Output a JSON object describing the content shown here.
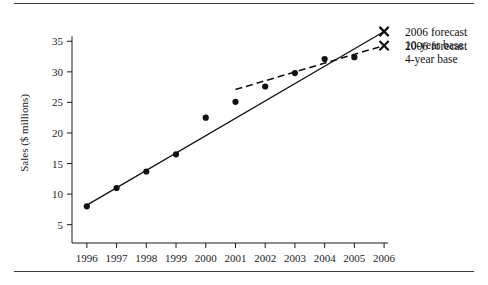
{
  "chart_data": {
    "type": "scatter",
    "title": "",
    "xlabel": "",
    "ylabel": "Sales ($ millions)",
    "x": [
      1996,
      1997,
      1998,
      1999,
      2000,
      2001,
      2002,
      2003,
      2004,
      2005
    ],
    "values": [
      8.0,
      11.0,
      13.7,
      16.5,
      22.5,
      25.1,
      27.6,
      29.8,
      32.1,
      32.4
    ],
    "xlim": [
      1995.5,
      2006.3
    ],
    "ylim": [
      2.0,
      37.5
    ],
    "xticks": [
      "1996",
      "1997",
      "1998",
      "1999",
      "2000",
      "2001",
      "2002",
      "2003",
      "2004",
      "2005",
      "2006"
    ],
    "xtick_values": [
      1996,
      1997,
      1998,
      1999,
      2000,
      2001,
      2002,
      2003,
      2004,
      2005,
      2006
    ],
    "yticks": [
      "5",
      "10",
      "15",
      "20",
      "25",
      "30",
      "35"
    ],
    "ytick_values": [
      5,
      10,
      15,
      20,
      25,
      30,
      35
    ],
    "grid": false,
    "legend_position": "top-right",
    "series": [
      {
        "name": "observed-sales",
        "style": "points",
        "x": [
          1996,
          1997,
          1998,
          1999,
          2000,
          2001,
          2002,
          2003,
          2004,
          2005
        ],
        "values": [
          8.0,
          11.0,
          13.7,
          16.5,
          22.5,
          25.1,
          27.6,
          29.8,
          32.1,
          32.4
        ]
      },
      {
        "name": "10-year base trend",
        "style": "solid-line",
        "x": [
          1996,
          2006
        ],
        "values": [
          8.2,
          36.6
        ],
        "endpoint_marker": "x",
        "endpoint_x": 2006,
        "endpoint_value": 36.6
      },
      {
        "name": "4-year base trend",
        "style": "dashed-line",
        "x": [
          2001,
          2006
        ],
        "values": [
          27.1,
          34.3
        ],
        "endpoint_marker": "x",
        "endpoint_x": 2006,
        "endpoint_value": 34.3
      }
    ],
    "annotations": [
      {
        "marker": "x",
        "lines": [
          "2006 forecast",
          "10-year base"
        ]
      },
      {
        "marker": "x",
        "lines": [
          "2006 forecast",
          "4-year base"
        ]
      }
    ]
  },
  "legend": {
    "entries": [
      {
        "marker": "x-marker",
        "line1": "2006 forecast",
        "line2": "10-year base"
      },
      {
        "marker": "x-marker",
        "line1": "2006 forecast",
        "line2": "4-year base"
      }
    ]
  },
  "axes": {
    "y_title": "Sales ($ millions)",
    "y_tick_labels": [
      "35",
      "30",
      "25",
      "20",
      "15",
      "10",
      "5"
    ],
    "x_tick_labels": [
      "1996",
      "1997",
      "1998",
      "1999",
      "2000",
      "2001",
      "2002",
      "2003",
      "2004",
      "2005",
      "2006"
    ]
  },
  "colors": {
    "ink": "#111111",
    "rule": "#3a3a3a",
    "background": "#ffffff"
  }
}
